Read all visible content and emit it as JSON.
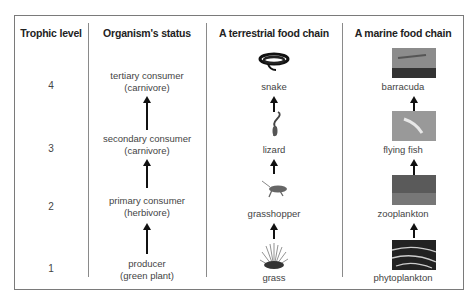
{
  "table": {
    "headers": [
      "Trophic level",
      "Organism's status",
      "A terrestrial food chain",
      "A marine food chain"
    ],
    "rows": [
      {
        "level": "4",
        "status_line1": "tertiary consumer",
        "status_line2": "(carnivore)",
        "terrestrial": "snake",
        "terrestrial_icon": "snake-icon",
        "marine": "barracuda",
        "marine_icon": "barracuda-photo"
      },
      {
        "level": "3",
        "status_line1": "secondary consumer",
        "status_line2": "(carnivore)",
        "terrestrial": "lizard",
        "terrestrial_icon": "lizard-icon",
        "marine": "flying fish",
        "marine_icon": "flying-fish-photo"
      },
      {
        "level": "2",
        "status_line1": "primary consumer",
        "status_line2": "(herbivore)",
        "terrestrial": "grasshopper",
        "terrestrial_icon": "grasshopper-icon",
        "marine": "zooplankton",
        "marine_icon": "zooplankton-photo"
      },
      {
        "level": "1",
        "status_line1": "producer",
        "status_line2": "(green plant)",
        "terrestrial": "grass",
        "terrestrial_icon": "grass-icon",
        "marine": "phytoplankton",
        "marine_icon": "phytoplankton-photo"
      }
    ]
  },
  "colors": {
    "border": "#7a7a7a",
    "arrow": "#111111",
    "text": "#444444"
  }
}
